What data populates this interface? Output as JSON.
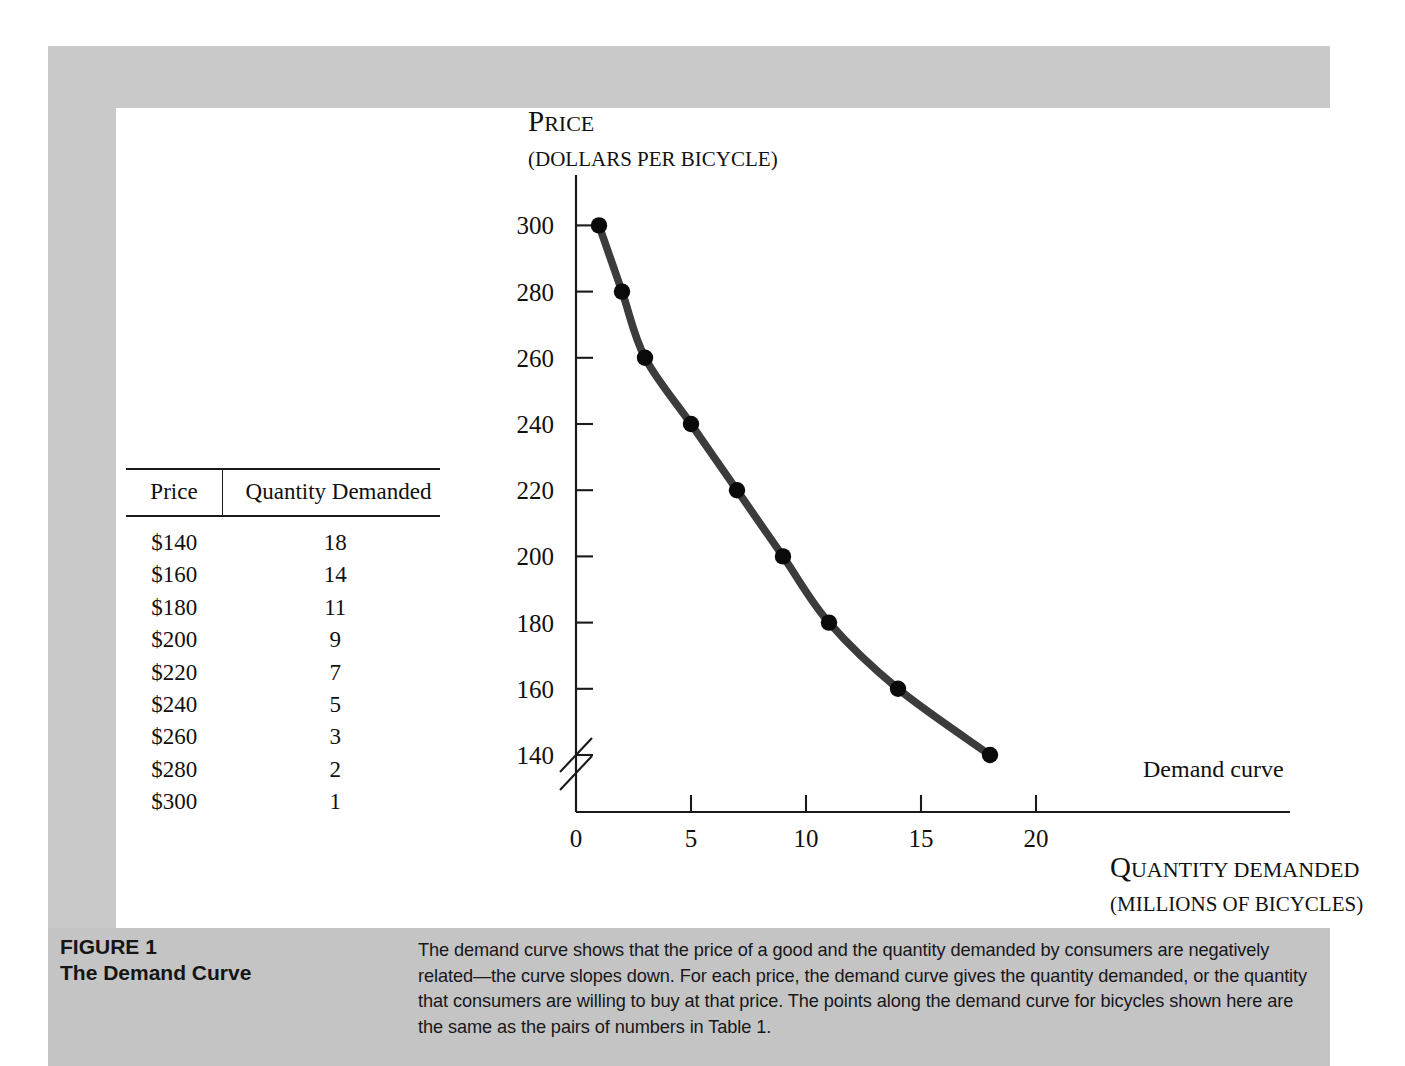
{
  "figure": {
    "number_label": "FIGURE 1",
    "title": "The Demand Curve",
    "caption": "The demand curve shows that the price of a good and the quantity demanded by consumers are negatively related—the curve slopes down. For each price, the demand curve gives the quantity demanded, or the quantity that consumers are willing to buy at that price. The points along the demand curve for bicycles shown here are the same as the pairs of numbers in Table 1."
  },
  "table": {
    "headers": [
      "Price",
      "Quantity Demanded"
    ],
    "rows": [
      [
        "$140",
        "18"
      ],
      [
        "$160",
        "14"
      ],
      [
        "$180",
        "11"
      ],
      [
        "$200",
        "9"
      ],
      [
        "$220",
        "7"
      ],
      [
        "$240",
        "5"
      ],
      [
        "$260",
        "3"
      ],
      [
        "$280",
        "2"
      ],
      [
        "$300",
        "1"
      ]
    ]
  },
  "chart_data": {
    "type": "line",
    "title": "",
    "series_label": "Demand curve",
    "y_axis_title_main": "P",
    "y_axis_title_rest": "RICE",
    "y_axis_title_sub": "(DOLLARS PER BICYCLE)",
    "x_axis_title_main": "Q",
    "x_axis_title_rest": "UANTITY DEMANDED",
    "x_axis_title_sub": "(MILLIONS OF BICYCLES)",
    "xlabel": "Quantity Demanded (millions of bicycles)",
    "ylabel": "Price (dollars per bicycle)",
    "x_ticks": [
      "0",
      "5",
      "10",
      "15",
      "20"
    ],
    "x_tick_values": [
      0,
      5,
      10,
      15,
      20
    ],
    "y_ticks": [
      "140",
      "160",
      "180",
      "200",
      "220",
      "240",
      "260",
      "280",
      "300"
    ],
    "y_tick_values": [
      140,
      160,
      180,
      200,
      220,
      240,
      260,
      280,
      300
    ],
    "xlim": [
      0,
      22
    ],
    "ylim": [
      140,
      300
    ],
    "y_axis_break": true,
    "grid": false,
    "legend": "none",
    "x": [
      1,
      2,
      3,
      5,
      7,
      9,
      11,
      14,
      18
    ],
    "values": [
      300,
      280,
      260,
      240,
      220,
      200,
      180,
      160,
      140
    ],
    "points": [
      {
        "q": 1,
        "p": 300
      },
      {
        "q": 2,
        "p": 280
      },
      {
        "q": 3,
        "p": 260
      },
      {
        "q": 5,
        "p": 240
      },
      {
        "q": 7,
        "p": 220
      },
      {
        "q": 9,
        "p": 200
      },
      {
        "q": 11,
        "p": 180
      },
      {
        "q": 14,
        "p": 160
      },
      {
        "q": 18,
        "p": 140
      }
    ],
    "curve_color": "#3c3c3c",
    "point_color": "#0a0a0a",
    "axis_color": "#1a1a1a"
  },
  "colors": {
    "frame_gray": "#c9c9c9",
    "caption_gray": "#c4c4c4",
    "canvas_white": "#ffffff",
    "text_black": "#111111"
  }
}
